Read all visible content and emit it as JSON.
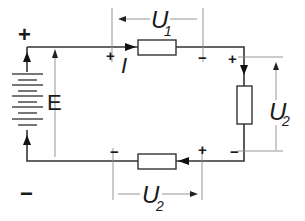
{
  "diagram": {
    "type": "series-circuit",
    "colors": {
      "wire": "#333333",
      "guide": "#8a8a8a",
      "background": "#ffffff"
    },
    "source": {
      "label": "E",
      "positive": "+",
      "negative": "−"
    },
    "current": {
      "label": "I"
    },
    "resistor_top": {
      "voltage_label": "U",
      "voltage_sub": "1",
      "plus": "+",
      "minus": "−"
    },
    "resistor_right": {
      "voltage_label": "U",
      "voltage_sub": "2",
      "plus": "+",
      "minus": "−"
    },
    "resistor_bottom": {
      "voltage_label": "U",
      "voltage_sub": "2",
      "plus": "+",
      "minus": "−"
    }
  }
}
